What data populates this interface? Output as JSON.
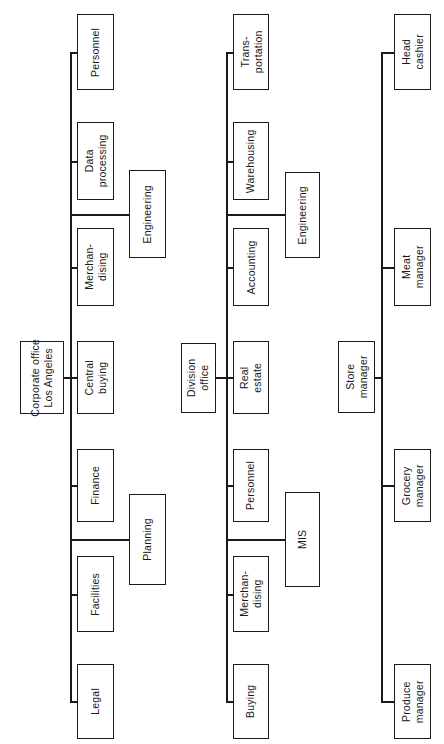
{
  "chart_data": {
    "type": "diagram",
    "orientation": "rotated-90-text-vertical",
    "canvas": {
      "width": 444,
      "height": 744
    },
    "trees": [
      {
        "id": "corporate",
        "root": "Corporate office\nLos Angeles",
        "children": [
          "Personnel",
          "Data\nprocessing",
          "Merchan-\ndising",
          "Central\nbuying",
          "Finance",
          "Facilities",
          "Legal"
        ],
        "sub_children": [
          "Engineering",
          "Planning"
        ]
      },
      {
        "id": "division",
        "root": "Division\noffice",
        "children": [
          "Trans-\nportation",
          "Warehousing",
          "Accounting",
          "Real\nestate",
          "Personnel",
          "Merchan-\ndising",
          "Buying"
        ],
        "sub_children": [
          "Engineering",
          "MIS"
        ]
      },
      {
        "id": "store",
        "root": "Store\nmanager",
        "children": [
          "Head\ncashier",
          "Meat\nmanager",
          "Grocery\nmanager",
          "Produce\nmanager"
        ],
        "sub_children": []
      }
    ]
  },
  "nodes": {
    "corp_root": {
      "label": "Corporate office\nLos Angeles",
      "x": 20,
      "y": 341,
      "w": 44,
      "h": 73
    },
    "corp_personnel": {
      "label": "Personnel",
      "x": 77,
      "y": 14,
      "w": 37,
      "h": 76
    },
    "corp_dataproc": {
      "label": "Data\nprocessing",
      "x": 77,
      "y": 122,
      "w": 37,
      "h": 78
    },
    "corp_merch": {
      "label": "Merchan-\ndising",
      "x": 77,
      "y": 228,
      "w": 37,
      "h": 78
    },
    "corp_central": {
      "label": "Central\nbuying",
      "x": 77,
      "y": 341,
      "w": 37,
      "h": 73
    },
    "corp_finance": {
      "label": "Finance",
      "x": 77,
      "y": 449,
      "w": 37,
      "h": 73
    },
    "corp_facilities": {
      "label": "Facilities",
      "x": 77,
      "y": 556,
      "w": 37,
      "h": 76
    },
    "corp_legal": {
      "label": "Legal",
      "x": 77,
      "y": 664,
      "w": 37,
      "h": 75
    },
    "corp_eng": {
      "label": "Engineering",
      "x": 129,
      "y": 170,
      "w": 37,
      "h": 88
    },
    "corp_planning": {
      "label": "Planning",
      "x": 129,
      "y": 494,
      "w": 37,
      "h": 91
    },
    "div_root": {
      "label": "Division\noffice",
      "x": 181,
      "y": 343,
      "w": 35,
      "h": 70
    },
    "div_trans": {
      "label": "Trans-\nportation",
      "x": 233,
      "y": 14,
      "w": 36,
      "h": 76
    },
    "div_warehouse": {
      "label": "Warehousing",
      "x": 233,
      "y": 122,
      "w": 36,
      "h": 78
    },
    "div_accounting": {
      "label": "Accounting",
      "x": 233,
      "y": 228,
      "w": 36,
      "h": 78
    },
    "div_realestate": {
      "label": "Real\nestate",
      "x": 233,
      "y": 341,
      "w": 36,
      "h": 73
    },
    "div_personnel": {
      "label": "Personnel",
      "x": 233,
      "y": 449,
      "w": 36,
      "h": 73
    },
    "div_merch": {
      "label": "Merchan-\ndising",
      "x": 233,
      "y": 556,
      "w": 36,
      "h": 76
    },
    "div_buying": {
      "label": "Buying",
      "x": 233,
      "y": 664,
      "w": 36,
      "h": 75
    },
    "div_eng": {
      "label": "Engineering",
      "x": 285,
      "y": 172,
      "w": 35,
      "h": 86
    },
    "div_mis": {
      "label": "MIS",
      "x": 285,
      "y": 492,
      "w": 35,
      "h": 95
    },
    "store_root": {
      "label": "Store\nmanager",
      "x": 338,
      "y": 341,
      "w": 37,
      "h": 72
    },
    "store_cashier": {
      "label": "Head\ncashier",
      "x": 394,
      "y": 14,
      "w": 37,
      "h": 76
    },
    "store_meat": {
      "label": "Meat\nmanager",
      "x": 394,
      "y": 228,
      "w": 37,
      "h": 78
    },
    "store_grocery": {
      "label": "Grocery\nmanager",
      "x": 394,
      "y": 449,
      "w": 37,
      "h": 73
    },
    "store_produce": {
      "label": "Produce\nmanager",
      "x": 394,
      "y": 664,
      "w": 37,
      "h": 75
    }
  },
  "colors": {
    "line": "#1a1a1a",
    "box_fill": "#ffffff",
    "background": "#ffffff"
  }
}
